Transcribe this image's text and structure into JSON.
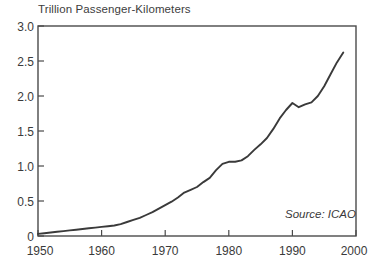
{
  "figure": {
    "background_color": "#ffffff",
    "axis_color": "#4a4a4a",
    "line_color": "#3a3a3a",
    "text_color": "#3a3a3a"
  },
  "title": "Trillion Passenger-Kilometers",
  "annotation": "Source: ICAO",
  "chart_data": {
    "type": "line",
    "title": "Trillion Passenger-Kilometers",
    "xlabel": "",
    "ylabel": "Trillion Passenger-Kilometers",
    "xlim": [
      1950,
      2000
    ],
    "ylim": [
      0,
      3.0
    ],
    "grid": false,
    "legend": "none",
    "annotations": [
      {
        "text": "Source: ICAO",
        "position": "bottom-right-inside"
      }
    ],
    "xticks": [
      1950,
      1960,
      1970,
      1980,
      1990,
      2000
    ],
    "xtick_labels": [
      "1950",
      "1960",
      "1970",
      "1980",
      "1990",
      "2000"
    ],
    "yticks": [
      0,
      0.5,
      1.0,
      1.5,
      2.0,
      2.5,
      3.0
    ],
    "ytick_labels": [
      "0",
      "0.5",
      "1.0",
      "1.5",
      "2.0",
      "2.5",
      "3.0"
    ],
    "series": [
      {
        "name": "World air passenger traffic",
        "x": [
          1950,
          1951,
          1952,
          1953,
          1954,
          1955,
          1956,
          1957,
          1958,
          1959,
          1960,
          1961,
          1962,
          1963,
          1964,
          1965,
          1966,
          1967,
          1968,
          1969,
          1970,
          1971,
          1972,
          1973,
          1974,
          1975,
          1976,
          1977,
          1978,
          1979,
          1980,
          1981,
          1982,
          1983,
          1984,
          1985,
          1986,
          1987,
          1988,
          1989,
          1990,
          1991,
          1992,
          1993,
          1994,
          1995,
          1996,
          1997,
          1998
        ],
        "values": [
          0.03,
          0.04,
          0.05,
          0.06,
          0.07,
          0.08,
          0.09,
          0.1,
          0.11,
          0.12,
          0.13,
          0.14,
          0.15,
          0.17,
          0.2,
          0.23,
          0.26,
          0.3,
          0.34,
          0.39,
          0.44,
          0.49,
          0.55,
          0.62,
          0.66,
          0.7,
          0.77,
          0.83,
          0.94,
          1.03,
          1.06,
          1.06,
          1.08,
          1.14,
          1.23,
          1.31,
          1.4,
          1.53,
          1.68,
          1.8,
          1.9,
          1.84,
          1.88,
          1.91,
          2.0,
          2.14,
          2.31,
          2.48,
          2.62
        ]
      }
    ]
  }
}
